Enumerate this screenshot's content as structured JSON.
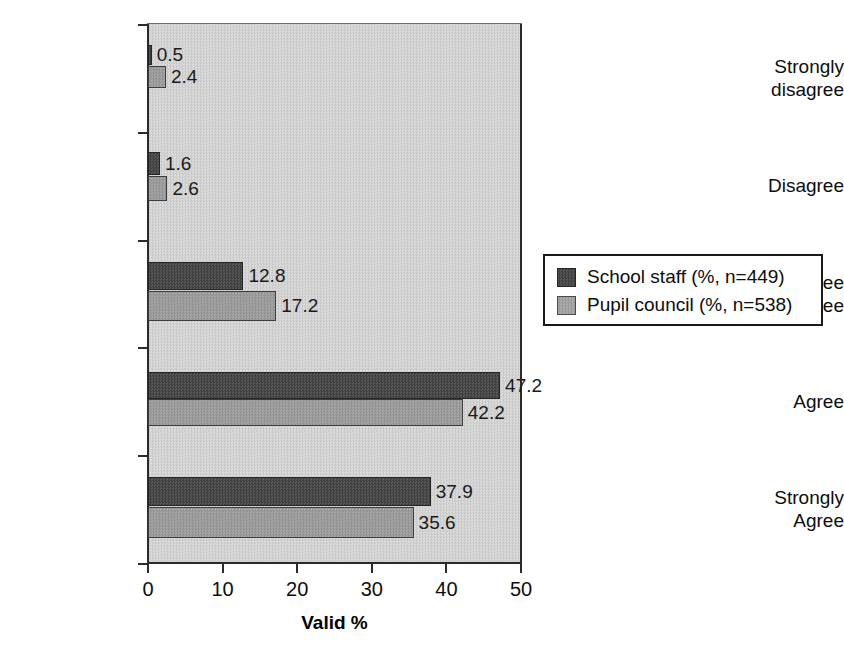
{
  "chart_data": {
    "type": "bar",
    "orientation": "horizontal",
    "title": "",
    "xlabel": "Valid %",
    "ylabel": "",
    "xlim": [
      0,
      50
    ],
    "xticks": [
      "0",
      "10",
      "20",
      "30",
      "40",
      "50"
    ],
    "grid": false,
    "legend_position": "right",
    "plot_background_color": "#d2d2d2",
    "categories": [
      "Strongly\ndisagree",
      "Disagree",
      "Don’t agree\nor disagree",
      "Agree",
      "Strongly\nAgree"
    ],
    "series": [
      {
        "name": "School staff (%, n=449)",
        "color": "#4b4b4b",
        "values": [
          0.5,
          1.6,
          12.8,
          47.2,
          37.9
        ],
        "labels": [
          "0.5",
          "1.6",
          "12.8",
          "47.2",
          "37.9"
        ]
      },
      {
        "name": "Pupil council (%, n=538)",
        "color": "#9b9b9b",
        "values": [
          2.4,
          2.6,
          17.2,
          42.2,
          35.6
        ],
        "labels": [
          "2.4",
          "2.6",
          "17.2",
          "42.2",
          "35.6"
        ]
      }
    ]
  },
  "legend": {
    "entries": [
      {
        "label": "School staff (%, n=449)",
        "swatch": "staff"
      },
      {
        "label": "Pupil council (%, n=538)",
        "swatch": "pupil"
      }
    ]
  },
  "axis": {
    "x_title": "Valid %",
    "x_tick_labels": [
      "0",
      "10",
      "20",
      "30",
      "40",
      "50"
    ],
    "category_labels": [
      "Strongly\ndisagree",
      "Disagree",
      "Don’t agree\nor disagree",
      "Agree",
      "Strongly\nAgree"
    ]
  },
  "values": {
    "staff": [
      "0.5",
      "1.6",
      "12.8",
      "47.2",
      "37.9"
    ],
    "pupil": [
      "2.4",
      "2.6",
      "17.2",
      "42.2",
      "35.6"
    ]
  }
}
